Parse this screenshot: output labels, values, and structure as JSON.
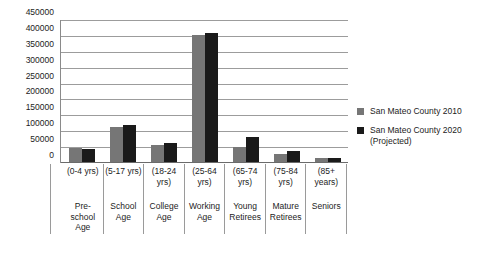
{
  "chart_data": {
    "type": "bar",
    "title": "",
    "subtitle": "",
    "xlabel": "",
    "ylabel": "",
    "ylim": [
      0,
      450000
    ],
    "ytick_step": 50000,
    "grid": true,
    "legend_position": "right",
    "categories": [
      "(0-4 yrs)",
      "(5-17 yrs)",
      "(18-24 yrs)",
      "(25-64 yrs)",
      "(65-74 yrs)",
      "(75-84 yrs)",
      "(85+ years)"
    ],
    "category_names": [
      "Pre-school Age",
      "School Age",
      "College Age",
      "Working Age",
      "Young Retirees",
      "Mature Retirees",
      "Seniors"
    ],
    "ytick_labels": [
      "450000",
      "400000",
      "350000",
      "300000",
      "250000",
      "200000",
      "150000",
      "100000",
      "50000",
      "0"
    ],
    "series": [
      {
        "name": "San Mateo County 2010",
        "color": "#767676",
        "values": [
          45000,
          112000,
          53000,
          404000,
          49000,
          26000,
          12000
        ]
      },
      {
        "name": "San Mateo County 2020 (Projected)",
        "color": "#1a1a1a",
        "values": [
          41000,
          118000,
          61000,
          408000,
          79000,
          34000,
          14000
        ]
      }
    ]
  },
  "legend": {
    "items": [
      {
        "label": "San Mateo County 2010",
        "swatch": "legend-swatch-gray"
      },
      {
        "label": "San Mateo County 2020 (Projected)",
        "swatch": "legend-swatch-black"
      }
    ]
  }
}
